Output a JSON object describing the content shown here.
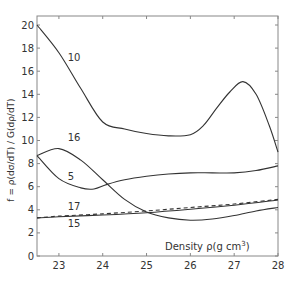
{
  "chart_data": {
    "type": "line",
    "title": "",
    "xlabel": "Density  ρ(g cm³)",
    "ylabel": "f = ρ(dσ/dT) / G(dρ/dT)",
    "xlim": [
      22.5,
      28
    ],
    "ylim": [
      0,
      20.8
    ],
    "xticks": [
      "23",
      "24",
      "25",
      "26",
      "27",
      "28"
    ],
    "yticks": [
      "0",
      "2",
      "4",
      "6",
      "8",
      "10",
      "12",
      "14",
      "16",
      "18",
      "20"
    ],
    "grid": false,
    "series": [
      {
        "name": "10",
        "style": "solid",
        "x": [
          22.5,
          23.0,
          23.5,
          24.0,
          24.5,
          25.0,
          25.5,
          26.0,
          26.3,
          26.6,
          26.9,
          27.2,
          27.5,
          27.8,
          28.0
        ],
        "y": [
          20.0,
          17.6,
          14.5,
          11.6,
          11.0,
          10.6,
          10.4,
          10.5,
          11.3,
          12.8,
          14.2,
          15.1,
          14.0,
          11.3,
          9.0
        ]
      },
      {
        "name": "16",
        "style": "solid",
        "x": [
          22.5,
          23.0,
          23.5,
          24.0,
          24.5,
          25.0,
          25.5,
          26.0,
          26.5,
          27.0,
          27.5,
          28.0
        ],
        "y": [
          8.7,
          9.3,
          8.3,
          6.6,
          4.9,
          3.8,
          3.3,
          3.1,
          3.2,
          3.5,
          3.9,
          4.2
        ]
      },
      {
        "name": "5",
        "style": "solid",
        "x": [
          22.5,
          23.0,
          23.5,
          23.8,
          24.1,
          24.5,
          25.0,
          25.5,
          26.0,
          26.5,
          27.0,
          27.5,
          28.0
        ],
        "y": [
          8.7,
          6.7,
          5.9,
          5.8,
          6.2,
          6.6,
          6.9,
          7.1,
          7.2,
          7.2,
          7.2,
          7.4,
          7.8
        ]
      },
      {
        "name": "17",
        "style": "dashed",
        "x": [
          22.5,
          23.0,
          24.0,
          25.0,
          26.0,
          27.0,
          28.0
        ],
        "y": [
          3.3,
          3.45,
          3.65,
          3.9,
          4.2,
          4.5,
          4.9
        ]
      },
      {
        "name": "15",
        "style": "solid",
        "x": [
          22.5,
          23.0,
          24.0,
          25.0,
          26.0,
          27.0,
          28.0
        ],
        "y": [
          3.3,
          3.4,
          3.55,
          3.75,
          4.05,
          4.4,
          4.85
        ]
      }
    ],
    "annotations": [
      {
        "text": "10",
        "x": 23.2,
        "y": 16.9
      },
      {
        "text": "16",
        "x": 23.2,
        "y": 10.0
      },
      {
        "text": "5",
        "x": 23.2,
        "y": 6.6
      },
      {
        "text": "17",
        "x": 23.2,
        "y": 4.0
      },
      {
        "text": "15",
        "x": 23.2,
        "y": 2.5
      }
    ]
  },
  "labels": {
    "xlabel_main": "Density  ρ(g cm",
    "xlabel_sup": "3",
    "xlabel_end": ")",
    "ylabel": "f = ρ(dσ/dT) / G(dρ/dT)"
  },
  "colors": {
    "line": "#333333",
    "axis": "#888888"
  }
}
